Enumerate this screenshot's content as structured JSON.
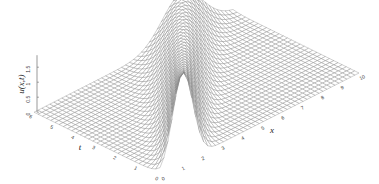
{
  "chart_data": {
    "type": "surface",
    "title": "",
    "xlabel": "x",
    "ylabel": "t",
    "zlabel": "u(x,t)",
    "x_range": [
      0,
      10
    ],
    "t_range": [
      0,
      6
    ],
    "z_range": [
      0,
      1.5
    ],
    "x_ticks": [
      "0",
      "1",
      "2",
      "3",
      "4",
      "5",
      "6",
      "7",
      "8",
      "9",
      "10"
    ],
    "t_ticks": [
      "0",
      "1",
      "2",
      "3",
      "4",
      "5",
      "6"
    ],
    "z_ticks": [
      "0",
      "0.5",
      "1",
      "1.5"
    ],
    "grid": {
      "x_intervals": 50,
      "t_intervals": 30
    },
    "surface": {
      "description": "Gaussian pulse advected along x with speed ~1 while decaying and spreading in t",
      "initial_center_x": 1.15,
      "speed": 1.05,
      "initial_amplitude": 3.0,
      "initial_width": 0.5,
      "spread_rate": 0.5
    },
    "colors": {
      "mesh": "#7a7a7a",
      "axis": "#555555",
      "background": "#ffffff"
    }
  }
}
